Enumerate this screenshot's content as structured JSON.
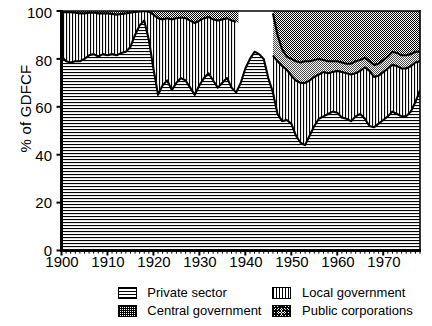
{
  "chart_data": {
    "type": "area",
    "title": "",
    "subtitle": "",
    "xlabel": "",
    "ylabel": "% of GDFCF",
    "xlim": [
      1900,
      1978
    ],
    "ylim": [
      0,
      100
    ],
    "grid": false,
    "stacked": true,
    "legend_position": "bottom",
    "y_ticks": [
      0,
      20,
      40,
      60,
      80,
      100
    ],
    "y_tick_labels": [
      "0",
      "20",
      "40",
      "60",
      "80",
      "100"
    ],
    "x_ticks": [
      1900,
      1910,
      1920,
      1930,
      1940,
      1950,
      1960,
      1970
    ],
    "x_tick_labels": [
      "1900",
      "1910",
      "1920",
      "1930",
      "1940",
      "1950",
      "1960",
      "1970"
    ],
    "x_minor_tick_interval": 1,
    "series": [
      {
        "name": "Private sector",
        "pattern": "horizontal-lines",
        "order": 1,
        "x": [
          1900,
          1901,
          1902,
          1903,
          1904,
          1905,
          1906,
          1907,
          1908,
          1909,
          1910,
          1911,
          1912,
          1913,
          1914,
          1915,
          1916,
          1917,
          1918,
          1919,
          1920,
          1921,
          1922,
          1923,
          1924,
          1925,
          1926,
          1927,
          1928,
          1929,
          1930,
          1931,
          1932,
          1933,
          1934,
          1935,
          1936,
          1937,
          1938,
          1939,
          1940,
          1941,
          1942,
          1943,
          1944,
          1945,
          1946,
          1947,
          1948,
          1949,
          1950,
          1951,
          1952,
          1953,
          1954,
          1955,
          1956,
          1957,
          1958,
          1959,
          1960,
          1961,
          1962,
          1963,
          1964,
          1965,
          1966,
          1967,
          1968,
          1969,
          1970,
          1971,
          1972,
          1973,
          1974,
          1975,
          1976,
          1977,
          1978
        ],
        "values": [
          81,
          79,
          78.5,
          79,
          79,
          80,
          81.5,
          82,
          81,
          82,
          81.5,
          82,
          81.5,
          82.5,
          83,
          85,
          90,
          94,
          96,
          88,
          76,
          65,
          69,
          71,
          67,
          70,
          72,
          71,
          68,
          65,
          69,
          72,
          74,
          71,
          68,
          70,
          72,
          68,
          66,
          70,
          76,
          80,
          83,
          82,
          80,
          72,
          66,
          57,
          54,
          54.5,
          53,
          48,
          45,
          44,
          48,
          52,
          55,
          56,
          57,
          58,
          57.5,
          55.5,
          55,
          54,
          56,
          57,
          55,
          52,
          51.5,
          53,
          54.5,
          56,
          58,
          57,
          56,
          56,
          58,
          62,
          67
        ]
      },
      {
        "name": "Local government",
        "pattern": "vertical-lines",
        "order": 2,
        "x": [
          1900,
          1901,
          1902,
          1903,
          1904,
          1905,
          1906,
          1907,
          1908,
          1909,
          1910,
          1911,
          1912,
          1913,
          1914,
          1915,
          1916,
          1917,
          1918,
          1919,
          1920,
          1921,
          1922,
          1923,
          1924,
          1925,
          1926,
          1927,
          1928,
          1929,
          1930,
          1931,
          1932,
          1933,
          1934,
          1935,
          1936,
          1937,
          1938,
          1946,
          1947,
          1948,
          1949,
          1950,
          1951,
          1952,
          1953,
          1954,
          1955,
          1956,
          1957,
          1958,
          1959,
          1960,
          1961,
          1962,
          1963,
          1964,
          1965,
          1966,
          1967,
          1968,
          1969,
          1970,
          1971,
          1972,
          1973,
          1974,
          1975,
          1976,
          1977,
          1978
        ],
        "cumulative_top": [
          99.5,
          99.5,
          99.5,
          99.3,
          99,
          99,
          99.3,
          99.4,
          99,
          99,
          99,
          98.8,
          98.5,
          98.8,
          99,
          99.3,
          99.6,
          99.8,
          100,
          99.7,
          98.5,
          97,
          96.5,
          97,
          96.5,
          97,
          97.3,
          97,
          96,
          95,
          96,
          97,
          97.5,
          96.5,
          96,
          96.5,
          97,
          96,
          95.5,
          81.5,
          79,
          77,
          75.5,
          73,
          71,
          70,
          70,
          71,
          72.5,
          73.5,
          74.5,
          74,
          74.5,
          75,
          74.5,
          74,
          73.5,
          74,
          75,
          76.5,
          75,
          72.5,
          73,
          74.5,
          76,
          77.5,
          77,
          76,
          76,
          77,
          78.5,
          79
        ]
      },
      {
        "name": "Public corporations",
        "pattern": "stipple-fine",
        "order": 3,
        "x": [
          1946,
          1947,
          1948,
          1949,
          1950,
          1951,
          1952,
          1953,
          1954,
          1955,
          1956,
          1957,
          1958,
          1959,
          1960,
          1961,
          1962,
          1963,
          1964,
          1965,
          1966,
          1967,
          1968,
          1969,
          1970,
          1971,
          1972,
          1973,
          1974,
          1975,
          1976,
          1977,
          1978
        ],
        "cumulative_top": [
          99,
          90,
          84,
          81,
          80,
          79,
          78.5,
          79,
          79,
          79.5,
          80,
          79.5,
          79,
          79,
          79,
          78.5,
          78,
          78,
          79,
          79.5,
          80.5,
          79,
          77.5,
          78,
          79.5,
          81,
          83,
          82.5,
          81.5,
          81.5,
          82,
          83,
          83
        ]
      },
      {
        "name": "Central government",
        "pattern": "stipple-dense",
        "order": 4,
        "x": [
          1900,
          1938,
          1946,
          1978
        ],
        "cumulative_top": [
          100,
          100,
          100,
          100
        ]
      }
    ]
  },
  "axes": {
    "y_label": "% of GDFCF",
    "y_ticks": [
      "100",
      "80",
      "60",
      "40",
      "20",
      "0"
    ],
    "x_ticks": [
      "1900",
      "1910",
      "1920",
      "1930",
      "1940",
      "1950",
      "1960",
      "1970"
    ]
  },
  "legend": {
    "items": [
      {
        "label": "Private sector",
        "pattern": "horizontal-lines",
        "swatch_name": "swatch-private-sector"
      },
      {
        "label": "Local government",
        "pattern": "vertical-lines",
        "swatch_name": "swatch-local-government"
      },
      {
        "label": "Central government",
        "pattern": "stipple-dense",
        "swatch_name": "swatch-central-government"
      },
      {
        "label": "Public corporations",
        "pattern": "stipple-fine",
        "swatch_name": "swatch-public-corporations"
      }
    ]
  },
  "colors": {
    "ink": "#000000",
    "paper": "#ffffff"
  }
}
